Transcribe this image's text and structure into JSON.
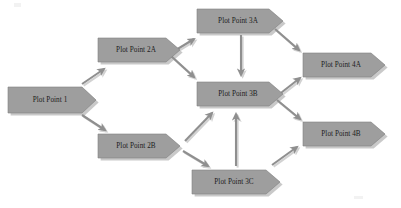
{
  "diagram": {
    "type": "flowchart",
    "title": "",
    "background_color": "#ffffff",
    "node_fill_color": "#9e9e9e",
    "node_stroke_color": "#7a7a7a",
    "node_shadow_color": "#c9c9c9",
    "arrow_color": "#8f8f8f",
    "label_color": "#1c1c1c",
    "node_shape": "pentagon-chevron",
    "nodes": [
      {
        "id": "pp1",
        "label": "Plot Point 1",
        "x": 8,
        "y": 87,
        "width": 88,
        "height": 26,
        "tip": 14
      },
      {
        "id": "pp2a",
        "label": "Plot Point 2A",
        "x": 98,
        "y": 38,
        "width": 84,
        "height": 24,
        "tip": 14
      },
      {
        "id": "pp2b",
        "label": "Plot Point 2B",
        "x": 98,
        "y": 134,
        "width": 84,
        "height": 24,
        "tip": 14
      },
      {
        "id": "pp3a",
        "label": "Plot Point 3A",
        "x": 197,
        "y": 9,
        "width": 88,
        "height": 24,
        "tip": 14
      },
      {
        "id": "pp3b",
        "label": "Plot Point 3B",
        "x": 197,
        "y": 82,
        "width": 88,
        "height": 24,
        "tip": 14
      },
      {
        "id": "pp3c",
        "label": "Plot Point 3C",
        "x": 192,
        "y": 170,
        "width": 90,
        "height": 24,
        "tip": 14
      },
      {
        "id": "pp4a",
        "label": "Plot Point 4A",
        "x": 303,
        "y": 53,
        "width": 84,
        "height": 24,
        "tip": 14
      },
      {
        "id": "pp4b",
        "label": "Plot Point 4B",
        "x": 303,
        "y": 122,
        "width": 84,
        "height": 24,
        "tip": 14
      }
    ],
    "edges": [
      {
        "id": "e1",
        "from": "pp1",
        "to": "pp2a",
        "style": "straight-diagonal"
      },
      {
        "id": "e2",
        "from": "pp1",
        "to": "pp2b",
        "style": "straight-diagonal"
      },
      {
        "id": "e3",
        "from": "pp2a",
        "to": "pp3a",
        "style": "straight-diagonal"
      },
      {
        "id": "e4",
        "from": "pp2a",
        "to": "pp3b",
        "style": "straight-diagonal"
      },
      {
        "id": "e5",
        "from": "pp3a",
        "to": "pp3b",
        "style": "vertical"
      },
      {
        "id": "e6",
        "from": "pp3a",
        "to": "pp4a",
        "style": "straight-diagonal"
      },
      {
        "id": "e7",
        "from": "pp3b",
        "to": "pp4a",
        "style": "straight-diagonal"
      },
      {
        "id": "e8",
        "from": "pp3b",
        "to": "pp4b",
        "style": "straight-diagonal"
      },
      {
        "id": "e9",
        "from": "pp2b",
        "to": "pp3b",
        "style": "straight-diagonal"
      },
      {
        "id": "e10",
        "from": "pp2b",
        "to": "pp3c",
        "style": "straight-diagonal"
      },
      {
        "id": "e11",
        "from": "pp3c",
        "to": "pp3b",
        "style": "vertical"
      },
      {
        "id": "e12",
        "from": "pp3c",
        "to": "pp4b",
        "style": "straight-diagonal"
      }
    ]
  }
}
